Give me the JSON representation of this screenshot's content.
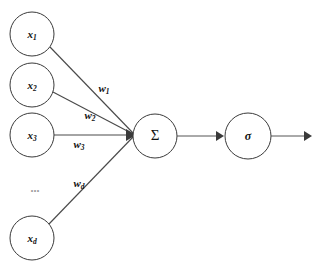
{
  "diagram": {
    "background_color": "#ffffff",
    "stroke_color": "#3a3a3a",
    "text_color": "#111111",
    "ellipsis_color": "#9a9a9a",
    "input_nodes": [
      {
        "id": "x1",
        "base": "x",
        "subscript": "1",
        "cx": 32,
        "cy": 34,
        "r": 22
      },
      {
        "id": "x2",
        "base": "x",
        "subscript": "2",
        "cx": 32,
        "cy": 85,
        "r": 22
      },
      {
        "id": "x3",
        "base": "x",
        "subscript": "3",
        "cx": 32,
        "cy": 135,
        "r": 22
      },
      {
        "id": "xd",
        "base": "x",
        "subscript": "d",
        "cx": 32,
        "cy": 238,
        "r": 22
      }
    ],
    "ellipsis": {
      "text": "...",
      "x": 35,
      "y": 189
    },
    "weights": [
      {
        "id": "w1",
        "base": "w",
        "subscript": "1",
        "x": 104,
        "y": 89
      },
      {
        "id": "w2",
        "base": "w",
        "subscript": "2",
        "x": 90,
        "y": 116
      },
      {
        "id": "w3",
        "base": "w",
        "subscript": "3",
        "x": 79,
        "y": 143
      },
      {
        "id": "wd",
        "base": "w",
        "subscript": "d",
        "x": 79,
        "y": 184
      }
    ],
    "sum_node": {
      "id": "sum",
      "label": "Σ",
      "cx": 155,
      "cy": 136,
      "r": 22
    },
    "activation_node": {
      "id": "activation",
      "label": "σ",
      "cx": 248,
      "cy": 136,
      "r": 23
    },
    "junction": {
      "x": 133,
      "y": 134
    },
    "output_arrow": {
      "x_start": 271,
      "x_end": 310,
      "y": 136
    },
    "inner_arrow": {
      "x_start": 177,
      "x_end": 222,
      "y": 136
    }
  }
}
